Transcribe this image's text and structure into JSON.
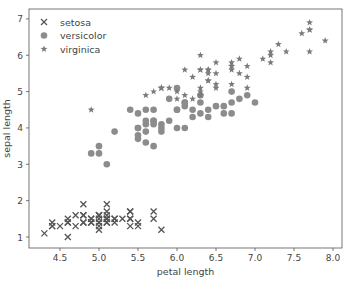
{
  "chart_data": {
    "type": "scatter",
    "title": "",
    "xlabel": "petal length",
    "ylabel": "sepal length",
    "xlim": [
      4.2,
      8.1
    ],
    "ylim": [
      0.7,
      7.3
    ],
    "xticks": [
      4.5,
      5.0,
      5.5,
      6.0,
      6.5,
      7.0,
      7.5,
      8.0
    ],
    "xtick_labels": [
      "4.5",
      "5.0",
      "5.5",
      "6.0",
      "6.5",
      "7.0",
      "7.5",
      "8.0"
    ],
    "yticks": [
      1,
      2,
      3,
      4,
      5,
      6,
      7
    ],
    "ytick_labels": [
      "1",
      "2",
      "3",
      "4",
      "5",
      "6",
      "7"
    ],
    "grid": false,
    "legend_position": "top-left",
    "series": [
      {
        "name": "setosa",
        "marker": "x",
        "color": "#555555",
        "x": [
          5.1,
          4.9,
          4.7,
          4.6,
          5.0,
          5.4,
          4.6,
          5.0,
          4.4,
          4.9,
          5.4,
          4.8,
          4.8,
          4.3,
          5.8,
          5.7,
          5.4,
          5.1,
          5.7,
          5.1,
          5.4,
          5.1,
          4.6,
          5.1,
          4.8,
          5.0,
          5.0,
          5.2,
          5.2,
          4.7,
          4.8,
          5.4,
          5.2,
          5.5,
          4.9,
          5.0,
          5.5,
          4.9,
          4.4,
          5.1,
          5.0,
          4.5,
          4.4,
          5.0,
          5.1,
          4.8,
          5.1,
          4.6,
          5.3,
          5.0
        ],
        "y": [
          1.4,
          1.4,
          1.3,
          1.5,
          1.4,
          1.7,
          1.4,
          1.5,
          1.4,
          1.5,
          1.5,
          1.6,
          1.4,
          1.1,
          1.2,
          1.5,
          1.3,
          1.4,
          1.7,
          1.5,
          1.7,
          1.5,
          1.0,
          1.7,
          1.9,
          1.6,
          1.6,
          1.5,
          1.4,
          1.6,
          1.6,
          1.5,
          1.5,
          1.4,
          1.5,
          1.2,
          1.3,
          1.4,
          1.3,
          1.5,
          1.3,
          1.3,
          1.3,
          1.6,
          1.9,
          1.4,
          1.6,
          1.4,
          1.5,
          1.4
        ]
      },
      {
        "name": "versicolor",
        "marker": "o",
        "color": "#8c8c8c",
        "x": [
          7.0,
          6.4,
          6.9,
          5.5,
          6.5,
          5.7,
          6.3,
          4.9,
          6.6,
          5.2,
          5.0,
          5.9,
          6.0,
          6.1,
          5.6,
          6.7,
          5.6,
          5.8,
          6.2,
          5.6,
          5.9,
          6.1,
          6.3,
          6.1,
          6.4,
          6.6,
          6.8,
          6.7,
          6.0,
          5.7,
          5.5,
          5.5,
          5.8,
          6.0,
          5.4,
          6.0,
          6.7,
          6.3,
          5.6,
          5.5,
          5.5,
          6.1,
          5.8,
          5.0,
          5.6,
          5.7,
          5.7,
          6.2,
          5.1,
          5.7
        ],
        "y": [
          4.7,
          4.5,
          4.9,
          4.0,
          4.6,
          4.5,
          4.7,
          3.3,
          4.6,
          3.9,
          3.5,
          4.2,
          4.0,
          4.7,
          3.6,
          4.4,
          4.5,
          4.1,
          4.5,
          3.9,
          4.8,
          4.0,
          4.9,
          4.7,
          4.3,
          4.4,
          4.8,
          5.0,
          4.5,
          3.5,
          3.8,
          3.7,
          3.9,
          5.1,
          4.5,
          4.5,
          4.7,
          4.4,
          4.1,
          4.0,
          4.4,
          4.6,
          4.0,
          3.3,
          4.2,
          4.2,
          4.2,
          4.3,
          3.0,
          4.1
        ]
      },
      {
        "name": "virginica",
        "marker": "*",
        "color": "#7a7a7a",
        "x": [
          6.3,
          5.8,
          7.1,
          6.3,
          6.5,
          7.6,
          4.9,
          7.3,
          6.7,
          7.2,
          6.5,
          6.4,
          6.8,
          5.7,
          5.8,
          6.4,
          6.5,
          7.7,
          7.7,
          6.0,
          6.9,
          5.6,
          7.7,
          6.3,
          6.7,
          7.2,
          6.2,
          6.1,
          6.4,
          7.2,
          7.4,
          7.9,
          6.4,
          6.3,
          6.1,
          7.7,
          6.3,
          6.4,
          6.0,
          6.9,
          6.7,
          6.9,
          5.8,
          6.8,
          6.7,
          6.7,
          6.3,
          6.5,
          6.2,
          5.9
        ],
        "y": [
          6.0,
          5.1,
          5.9,
          5.6,
          5.8,
          6.6,
          4.5,
          6.3,
          5.8,
          6.1,
          5.1,
          5.3,
          5.5,
          5.0,
          5.1,
          5.3,
          5.5,
          6.7,
          6.9,
          5.0,
          5.7,
          4.9,
          6.7,
          4.9,
          5.7,
          6.0,
          4.8,
          4.9,
          5.6,
          5.8,
          6.1,
          6.4,
          5.6,
          5.1,
          5.6,
          6.1,
          5.6,
          5.5,
          4.8,
          5.4,
          5.6,
          5.1,
          5.1,
          5.9,
          5.7,
          5.2,
          5.0,
          5.2,
          5.4,
          5.1
        ]
      }
    ]
  }
}
